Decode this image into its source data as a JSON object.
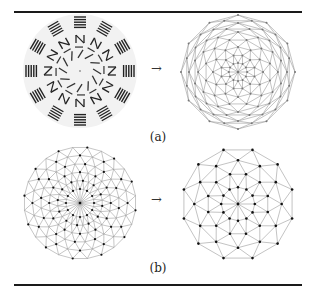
{
  "figure": {
    "rules": [
      "top",
      "bottom"
    ],
    "rows": [
      {
        "caption": "(a)",
        "arrow": "→",
        "left": {
          "kind": "glyph-ring",
          "center": [
            80,
            71
          ],
          "radius": 57,
          "sectors": 12,
          "description": "radial arrangement of glyph fragments (bars, N, Π, Ш shapes)"
        },
        "right": {
          "kind": "mesh-dense-rings",
          "center": [
            238,
            72
          ],
          "radius": 57,
          "sides": 12,
          "rings": [
            0.16,
            0.3,
            0.44,
            0.58,
            0.7,
            0.78,
            0.86,
            0.93,
            1.0
          ],
          "edge_color": "#9a9a9a",
          "node_color": "#777777"
        }
      },
      {
        "caption": "(b)",
        "arrow": "→",
        "left": {
          "kind": "mesh-circular",
          "center": [
            80,
            203
          ],
          "radius": 56,
          "spokes": 24,
          "rings": [
            0.25,
            0.4,
            0.55,
            0.7,
            0.85,
            1.0
          ],
          "edge_color": "#8c8c8c",
          "node_color": "#111111"
        },
        "right": {
          "kind": "mesh-sparse",
          "center": [
            238,
            204
          ],
          "radius": 56,
          "sides": 12,
          "rings": [
            0.3,
            0.55,
            0.78,
            1.0
          ],
          "edge_color": "#9a9a9a",
          "node_color": "#111111"
        }
      }
    ]
  }
}
